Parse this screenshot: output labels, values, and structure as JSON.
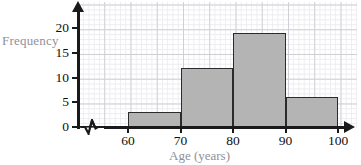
{
  "chart_data": {
    "type": "bar",
    "title": "",
    "subtitle": "",
    "xlabel": "Age (years)",
    "ylabel": "Frequency",
    "categories": [
      "60-70",
      "70-80",
      "80-90",
      "90-100"
    ],
    "bin_edges": [
      60,
      70,
      80,
      90,
      100
    ],
    "values": [
      3,
      12,
      19,
      6
    ],
    "series": [
      {
        "name": "Frequency",
        "values": [
          3,
          12,
          19,
          6
        ]
      }
    ],
    "xlim": [
      60,
      100
    ],
    "ylim": [
      0,
      20
    ],
    "x_ticks": [
      "60",
      "70",
      "80",
      "90",
      "100"
    ],
    "y_ticks": [
      "0",
      "5",
      "10",
      "15",
      "20"
    ],
    "grid": true,
    "legend": false,
    "legend_position": "none",
    "x_axis_break": true,
    "annotations": [],
    "colors": {
      "bar_fill": "#b4b4b4",
      "bar_stroke": "#2b2b2b",
      "axis": "#1a1a1a",
      "grid_minor": "#ececf1",
      "grid_major": "#cfcfd6",
      "axis_title": "#909098",
      "tick_label": "#101010",
      "background": "#ffffff"
    }
  },
  "axes": {
    "y_title": "Frequency",
    "x_title": "Age (years)",
    "y_ticks": [
      {
        "label": "0",
        "value": 0
      },
      {
        "label": "5",
        "value": 5
      },
      {
        "label": "10",
        "value": 10
      },
      {
        "label": "15",
        "value": 15
      },
      {
        "label": "20",
        "value": 20
      }
    ],
    "x_ticks": [
      {
        "label": "60",
        "value": 60
      },
      {
        "label": "70",
        "value": 70
      },
      {
        "label": "80",
        "value": 80
      },
      {
        "label": "90",
        "value": 90
      },
      {
        "label": "100",
        "value": 100
      }
    ]
  },
  "bars": [
    {
      "label": "60-70",
      "start": 60,
      "end": 70,
      "value": 3
    },
    {
      "label": "70-80",
      "start": 70,
      "end": 80,
      "value": 12
    },
    {
      "label": "80-90",
      "start": 80,
      "end": 90,
      "value": 19
    },
    {
      "label": "90-100",
      "start": 90,
      "end": 100,
      "value": 6
    }
  ]
}
